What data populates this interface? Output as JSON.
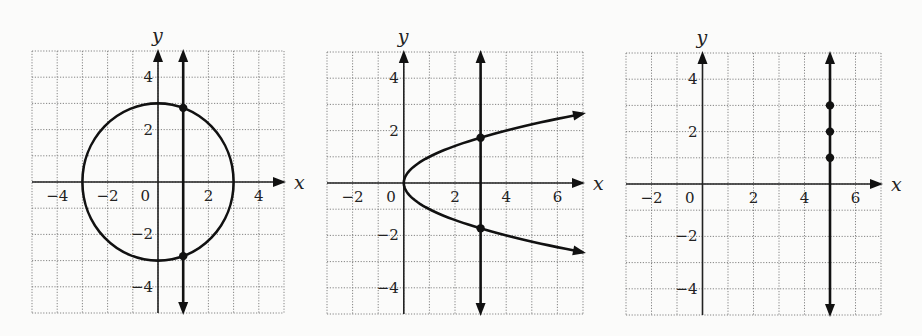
{
  "chart_data": [
    {
      "type": "line",
      "title": "",
      "xlabel": "x",
      "ylabel": "y",
      "xlim": [
        -5,
        5
      ],
      "ylim": [
        -5,
        5
      ],
      "grid": true,
      "x_tick_labels": [
        {
          "v": -4,
          "label": "−4"
        },
        {
          "v": -2,
          "label": "−2"
        },
        {
          "v": 0,
          "label": "0"
        },
        {
          "v": 2,
          "label": "2"
        },
        {
          "v": 4,
          "label": "4"
        }
      ],
      "y_tick_labels": [
        {
          "v": 4,
          "label": "4"
        },
        {
          "v": 2,
          "label": "2"
        },
        {
          "v": -2,
          "label": "−2"
        },
        {
          "v": -4,
          "label": "−4"
        }
      ],
      "series": [
        {
          "name": "circle x^2 + y^2 = 9",
          "kind": "circle",
          "cx": 0,
          "cy": 0,
          "r": 3
        },
        {
          "name": "vertical line x = 1",
          "kind": "vline",
          "x": 1
        }
      ],
      "points": [
        {
          "x": 1,
          "y": 2.83
        },
        {
          "x": 1,
          "y": -2.83
        }
      ],
      "frame": {
        "left": 32,
        "top": 51,
        "right": 284,
        "bottom": 313
      }
    },
    {
      "type": "line",
      "title": "",
      "xlabel": "x",
      "ylabel": "y",
      "xlim": [
        -3,
        7
      ],
      "ylim": [
        -5,
        5
      ],
      "grid": true,
      "x_tick_labels": [
        {
          "v": -2,
          "label": "−2"
        },
        {
          "v": 0,
          "label": "0"
        },
        {
          "v": 2,
          "label": "2"
        },
        {
          "v": 4,
          "label": "4"
        },
        {
          "v": 6,
          "label": "6"
        }
      ],
      "y_tick_labels": [
        {
          "v": 4,
          "label": "4"
        },
        {
          "v": 2,
          "label": "2"
        },
        {
          "v": -2,
          "label": "−2"
        },
        {
          "v": -4,
          "label": "−4"
        }
      ],
      "series": [
        {
          "name": "parabola x = y^2",
          "kind": "sideways-parabola",
          "a": 1,
          "x_max": 7
        },
        {
          "name": "vertical line x = 3",
          "kind": "vline",
          "x": 3
        }
      ],
      "points": [
        {
          "x": 3,
          "y": 1.73
        },
        {
          "x": 3,
          "y": -1.73
        }
      ],
      "frame": {
        "left": 327,
        "top": 52,
        "right": 583,
        "bottom": 314
      }
    },
    {
      "type": "scatter",
      "title": "",
      "xlabel": "x",
      "ylabel": "y",
      "xlim": [
        -3,
        7
      ],
      "ylim": [
        -5,
        5
      ],
      "grid": true,
      "x_tick_labels": [
        {
          "v": -2,
          "label": "−2"
        },
        {
          "v": 0,
          "label": "0"
        },
        {
          "v": 2,
          "label": "2"
        },
        {
          "v": 4,
          "label": "4"
        },
        {
          "v": 6,
          "label": "6"
        }
      ],
      "y_tick_labels": [
        {
          "v": 4,
          "label": "4"
        },
        {
          "v": 2,
          "label": "2"
        },
        {
          "v": -2,
          "label": "−2"
        },
        {
          "v": -4,
          "label": "−4"
        }
      ],
      "series": [
        {
          "name": "vertical line x = 5",
          "kind": "vline",
          "x": 5
        }
      ],
      "points": [
        {
          "x": 5,
          "y": 3
        },
        {
          "x": 5,
          "y": 2
        },
        {
          "x": 5,
          "y": 1
        }
      ],
      "frame": {
        "left": 626,
        "top": 53,
        "right": 881,
        "bottom": 315
      }
    }
  ]
}
